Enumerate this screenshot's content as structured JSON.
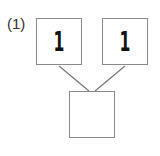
{
  "problem": {
    "label": "(1)",
    "top_left": "1",
    "top_right": "1",
    "bottom": ""
  },
  "colors": {
    "box_border": "#8a8a8a",
    "line": "#777777",
    "text": "#111111"
  }
}
